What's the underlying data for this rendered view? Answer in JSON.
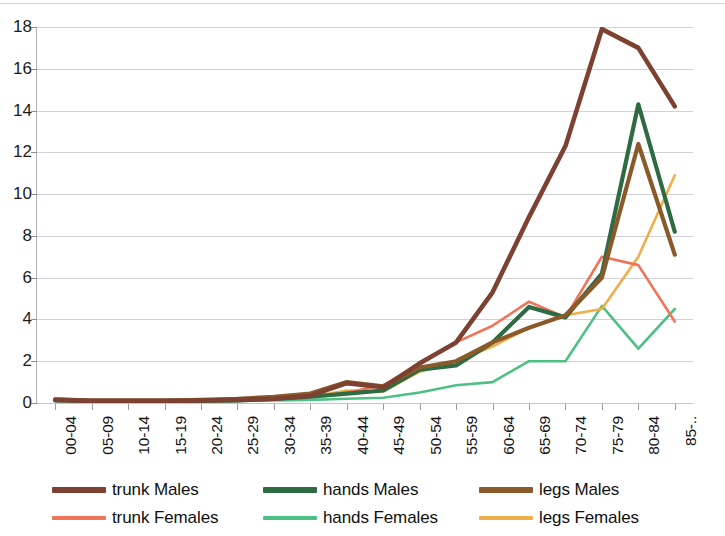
{
  "chart_data": {
    "type": "line",
    "title": "",
    "subtitle": "",
    "xlabel": "",
    "ylabel": "",
    "ylim": [
      0,
      18
    ],
    "ytick_step": 2,
    "yticks": [
      0,
      2,
      4,
      6,
      8,
      10,
      12,
      14,
      16,
      18
    ],
    "ytick_labels": [
      "0",
      "2",
      "4",
      "6",
      "8",
      "10",
      "12",
      "14",
      "16",
      "18"
    ],
    "grid": true,
    "grid_axis": "y",
    "legend_position": "bottom",
    "legend_columns": 3,
    "categories": [
      "00-04",
      "05-09",
      "10-14",
      "15-19",
      "20-24",
      "25-29",
      "30-34",
      "35-39",
      "40-44",
      "45-49",
      "50-54",
      "55-59",
      "60-64",
      "65-69",
      "70-74",
      "75-79",
      "80-84",
      "85-.."
    ],
    "series": [
      {
        "name": "trunk Males",
        "color": "#7d4132",
        "values": [
          0.15,
          0.1,
          0.1,
          0.1,
          0.12,
          0.15,
          0.2,
          0.35,
          0.95,
          0.75,
          1.9,
          2.9,
          5.3,
          8.9,
          12.3,
          17.9,
          17.0,
          14.2
        ]
      },
      {
        "name": "trunk Females",
        "color": "#ef7458",
        "values": [
          0.12,
          0.1,
          0.1,
          0.1,
          0.1,
          0.12,
          0.18,
          0.3,
          0.5,
          0.85,
          1.85,
          2.9,
          3.7,
          4.85,
          4.1,
          7.0,
          6.6,
          3.9
        ]
      },
      {
        "name": "hands Males",
        "color": "#2e6b43",
        "values": [
          0.12,
          0.1,
          0.1,
          0.1,
          0.1,
          0.12,
          0.2,
          0.3,
          0.45,
          0.6,
          1.6,
          1.8,
          2.9,
          4.6,
          4.1,
          6.2,
          14.3,
          8.2
        ]
      },
      {
        "name": "hands Females",
        "color": "#4fc085",
        "values": [
          0.1,
          0.1,
          0.1,
          0.1,
          0.1,
          0.1,
          0.12,
          0.15,
          0.2,
          0.25,
          0.5,
          0.85,
          1.0,
          2.0,
          2.0,
          4.65,
          2.6,
          4.5
        ]
      },
      {
        "name": "legs Males",
        "color": "#8a5a2b",
        "values": [
          0.18,
          0.12,
          0.12,
          0.12,
          0.15,
          0.2,
          0.3,
          0.45,
          1.0,
          0.8,
          1.7,
          2.0,
          2.9,
          3.6,
          4.2,
          6.0,
          12.4,
          7.1
        ]
      },
      {
        "name": "legs Females",
        "color": "#f0ae48",
        "values": [
          0.15,
          0.1,
          0.1,
          0.1,
          0.1,
          0.12,
          0.2,
          0.3,
          0.6,
          0.55,
          1.5,
          2.0,
          2.7,
          3.6,
          4.2,
          4.5,
          7.0,
          10.9
        ]
      }
    ]
  },
  "legend": {
    "items": [
      {
        "label": "trunk Males",
        "color": "#7d4132"
      },
      {
        "label": "hands Males",
        "color": "#2e6b43"
      },
      {
        "label": "legs Males",
        "color": "#8a5a2b"
      },
      {
        "label": "trunk Females",
        "color": "#ef7458"
      },
      {
        "label": "hands Females",
        "color": "#4fc085"
      },
      {
        "label": "legs Females",
        "color": "#f0ae48"
      }
    ]
  }
}
